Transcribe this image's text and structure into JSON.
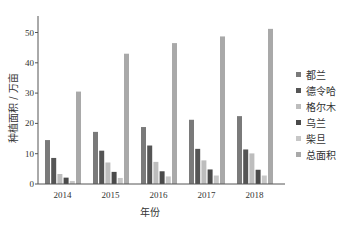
{
  "chart_data": {
    "type": "bar",
    "title": "",
    "xlabel": "年份",
    "ylabel": "种植面积 / 万亩",
    "ylim": [
      0,
      55
    ],
    "yticks": [
      0,
      10,
      20,
      30,
      40,
      50
    ],
    "categories": [
      "2014",
      "2015",
      "2016",
      "2017",
      "2018"
    ],
    "grid": false,
    "legend_position": "right",
    "series": [
      {
        "name": "都兰",
        "color": "#7a7a7a",
        "values": [
          14.5,
          17.2,
          18.8,
          21.2,
          22.4
        ]
      },
      {
        "name": "德令哈",
        "color": "#555555",
        "values": [
          8.6,
          11.0,
          12.7,
          11.6,
          11.4
        ]
      },
      {
        "name": "格尔木",
        "color": "#bdbdbd",
        "values": [
          3.3,
          7.1,
          7.3,
          7.8,
          10.1
        ]
      },
      {
        "name": "乌兰",
        "color": "#4a4a4a",
        "values": [
          2.1,
          4.0,
          4.2,
          4.8,
          4.7
        ]
      },
      {
        "name": "柴旦",
        "color": "#c7c7c7",
        "values": [
          1.0,
          2.0,
          2.5,
          2.8,
          2.8
        ]
      },
      {
        "name": "总面积",
        "color": "#a9a9a9",
        "values": [
          30.5,
          43.0,
          46.5,
          48.7,
          51.2
        ]
      }
    ]
  }
}
